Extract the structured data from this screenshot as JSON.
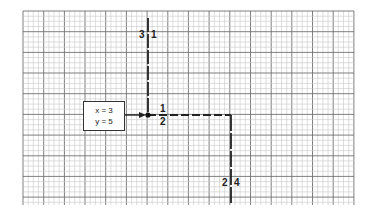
{
  "diagram": {
    "type": "grid-path-diagram",
    "grid": {
      "left": 23,
      "top": 11,
      "right": 354,
      "bottom": 205,
      "minor_spacing": 5.17,
      "major_every": 4,
      "minor_color": "#c8c8c8",
      "major_color": "#707070"
    },
    "input_box": {
      "line1": "x = 3",
      "line2": "y = 5"
    },
    "labels": {
      "top_left": "3",
      "top_right": "1",
      "mid_above": "1",
      "mid_below": "2",
      "bottom_left": "2",
      "bottom_right": "4"
    },
    "path": {
      "origin_dot": [
        148,
        115
      ],
      "segments": [
        {
          "from": [
            148,
            18
          ],
          "to": [
            148,
            115
          ],
          "label_left": "3",
          "label_right": "1"
        },
        {
          "from": [
            148,
            115
          ],
          "to": [
            231,
            115
          ],
          "label_above": "1",
          "label_below": "2"
        },
        {
          "from": [
            231,
            115
          ],
          "to": [
            231,
            205
          ],
          "label_left": "2",
          "label_right": "4"
        }
      ],
      "arrow": {
        "from": [
          133,
          115
        ],
        "to": [
          146,
          115
        ]
      },
      "line_color": "#222222"
    }
  }
}
